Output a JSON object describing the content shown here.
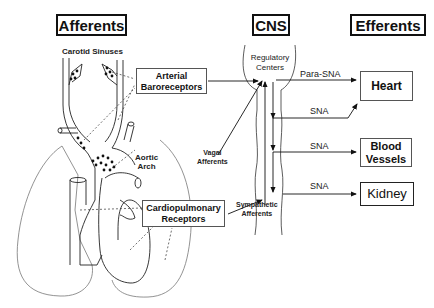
{
  "headers": {
    "afferents": "Afferents",
    "cns": "CNS",
    "efferents": "Efferents"
  },
  "afferent_labels": {
    "carotid_sinuses": "Carotid Sinuses",
    "aortic_arch_line1": "Aortic",
    "aortic_arch_line2": "Arch",
    "vagal_line1": "Vagal",
    "vagal_line2": "Afferents",
    "sympathetic_line1": "Sympathetic",
    "sympathetic_line2": "Afferents"
  },
  "receptor_boxes": {
    "arterial_line1": "Arterial",
    "arterial_line2": "Baroreceptors",
    "cardio_line1": "Cardiopulmonary",
    "cardio_line2": "Receptors"
  },
  "cns": {
    "regulatory_line1": "Regulatory",
    "regulatory_line2": "Centers"
  },
  "efferent_signals": {
    "para_sna": "Para-SNA",
    "sna_heart": "SNA",
    "sna_vessels": "SNA",
    "sna_kidney": "SNA"
  },
  "targets": {
    "heart": "Heart",
    "vessels_line1": "Blood",
    "vessels_line2": "Vessels",
    "kidney": "Kidney"
  }
}
